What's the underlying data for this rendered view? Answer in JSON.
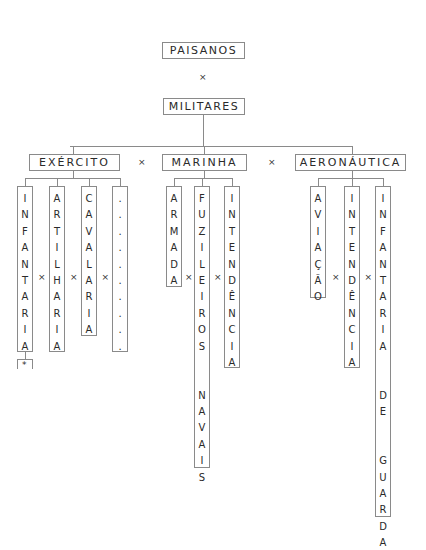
{
  "diagram": {
    "root_top": "PAISANOS",
    "root_sep": "×",
    "root_main": "MILITARES",
    "branch_sep": "×",
    "branches": [
      {
        "label": "EXÉRCITO",
        "x": 29,
        "w": 91,
        "cx": 73,
        "columns": [
          {
            "text": "INFANTARIA",
            "x": 17,
            "bottom": 352
          },
          {
            "text": "ARTILHARIA",
            "x": 49,
            "bottom": 352
          },
          {
            "text": "CAVALARIA",
            "x": 81,
            "bottom": 336
          },
          {
            "text": "..........",
            "x": 112,
            "bottom": 352
          }
        ],
        "footnote": "*"
      },
      {
        "label": "MARINHA",
        "x": 162,
        "w": 85,
        "cx": 204,
        "columns": [
          {
            "text": "ARMADA",
            "x": 166,
            "bottom": 287
          },
          {
            "text": "FUZILEIROS  NAVAIS",
            "x": 194,
            "bottom": 468
          },
          {
            "text": "INTENDÊNCIA",
            "x": 224,
            "bottom": 368
          }
        ]
      },
      {
        "label": "AERONÁUTICA",
        "x": 295,
        "w": 111,
        "cx": 352,
        "columns": [
          {
            "text": "AVIAÇÃO",
            "x": 310,
            "bottom": 298
          },
          {
            "text": "INTENDÊNCIA",
            "x": 344,
            "bottom": 368
          },
          {
            "text": "INFANTARIA  DE  GUARDA",
            "x": 375,
            "bottom": 517
          }
        ]
      }
    ]
  }
}
